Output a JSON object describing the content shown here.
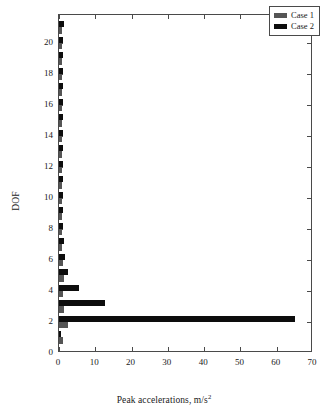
{
  "chart_data": {
    "type": "bar",
    "orientation": "horizontal",
    "title": "",
    "xlabel": "Peak accelerations, m/s",
    "xlabel_superscript": "2",
    "ylabel": "DOF",
    "xlim": [
      0,
      70
    ],
    "ylim": [
      0,
      21.8
    ],
    "xticks": [
      0,
      10,
      20,
      30,
      40,
      50,
      60,
      70
    ],
    "yticks": [
      0,
      2,
      4,
      6,
      8,
      10,
      12,
      14,
      16,
      18,
      20
    ],
    "xtick_labels": [
      "0",
      "10",
      "20",
      "30",
      "40",
      "50",
      "60",
      "70"
    ],
    "ytick_labels": [
      "0",
      "2",
      "4",
      "6",
      "8",
      "10",
      "12",
      "14",
      "16",
      "18",
      "20"
    ],
    "grid": false,
    "categories": [
      1,
      2,
      3,
      4,
      5,
      6,
      7,
      8,
      9,
      10,
      11,
      12,
      13,
      14,
      15,
      16,
      17,
      18,
      19,
      20,
      21
    ],
    "series": [
      {
        "name": "Case 1",
        "color": "#555555",
        "values": [
          1.0,
          2.6,
          1.4,
          1.2,
          1.3,
          1.0,
          0.9,
          0.8,
          0.8,
          0.7,
          0.8,
          0.7,
          0.8,
          0.7,
          0.8,
          0.7,
          0.8,
          0.7,
          0.8,
          0.7,
          0.9
        ]
      },
      {
        "name": "Case 2",
        "color": "#0d0d0d",
        "values": [
          0.6,
          65.0,
          12.8,
          5.6,
          2.6,
          1.6,
          1.3,
          1.1,
          1.2,
          1.0,
          1.2,
          1.0,
          1.2,
          1.0,
          1.2,
          1.0,
          1.2,
          1.1,
          1.2,
          1.1,
          1.3
        ]
      }
    ],
    "legend": {
      "position": "top-right",
      "entries": [
        {
          "label": "Case 1",
          "color": "#555555"
        },
        {
          "label": "Case 2",
          "color": "#0d0d0d"
        }
      ]
    }
  }
}
